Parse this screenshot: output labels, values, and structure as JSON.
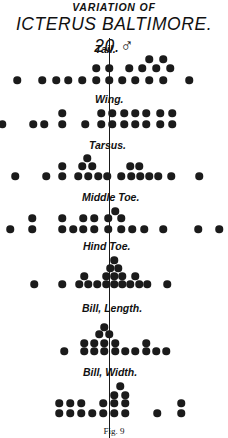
{
  "title": {
    "line1": "VARIATION OF",
    "line2": "ICTERUS BALTIMORE. 20.♂"
  },
  "caption": "Fig. 9",
  "chart_data": {
    "type": "scatter",
    "axis_line_x": 109,
    "series": [
      {
        "name": "Tail.",
        "label_x": 95,
        "label_y": 43,
        "points": [
          [
            17,
            80
          ],
          [
            42,
            80
          ],
          [
            56,
            80
          ],
          [
            68,
            80
          ],
          [
            82,
            80
          ],
          [
            96,
            80
          ],
          [
            109,
            80
          ],
          [
            122,
            80
          ],
          [
            135,
            80
          ],
          [
            149,
            80
          ],
          [
            163,
            80
          ],
          [
            189,
            80
          ],
          [
            96,
            68
          ],
          [
            109,
            68
          ],
          [
            129,
            68
          ],
          [
            142,
            68
          ],
          [
            156,
            68
          ],
          [
            170,
            68
          ],
          [
            149,
            59
          ],
          [
            163,
            59
          ]
        ]
      },
      {
        "name": "Wing.",
        "label_x": 95,
        "label_y": 93,
        "points": [
          [
            2,
            124
          ],
          [
            33,
            124
          ],
          [
            44,
            124
          ],
          [
            62,
            124
          ],
          [
            85,
            124
          ],
          [
            101,
            124
          ],
          [
            112,
            124
          ],
          [
            124,
            124
          ],
          [
            135,
            124
          ],
          [
            146,
            124
          ],
          [
            160,
            124
          ],
          [
            172,
            124
          ],
          [
            62,
            113
          ],
          [
            101,
            113
          ],
          [
            112,
            113
          ],
          [
            124,
            113
          ],
          [
            135,
            113
          ],
          [
            146,
            113
          ],
          [
            160,
            113
          ],
          [
            172,
            113
          ]
        ]
      },
      {
        "name": "Tarsus.",
        "label_x": 89,
        "label_y": 139,
        "points": [
          [
            15,
            176
          ],
          [
            46,
            176
          ],
          [
            62,
            176
          ],
          [
            78,
            176
          ],
          [
            88,
            176
          ],
          [
            98,
            176
          ],
          [
            107,
            176
          ],
          [
            121,
            176
          ],
          [
            131,
            176
          ],
          [
            140,
            176
          ],
          [
            149,
            176
          ],
          [
            158,
            176
          ],
          [
            171,
            176
          ],
          [
            199,
            176
          ],
          [
            62,
            166
          ],
          [
            82,
            166
          ],
          [
            92,
            166
          ],
          [
            130,
            166
          ],
          [
            139,
            166
          ],
          [
            87,
            158
          ]
        ]
      },
      {
        "name": "Middle Toe.",
        "label_x": 82,
        "label_y": 191,
        "points": [
          [
            10,
            229
          ],
          [
            32,
            229
          ],
          [
            62,
            229
          ],
          [
            73,
            229
          ],
          [
            83,
            229
          ],
          [
            94,
            229
          ],
          [
            108,
            229
          ],
          [
            121,
            229
          ],
          [
            132,
            229
          ],
          [
            144,
            229
          ],
          [
            163,
            229
          ],
          [
            198,
            229
          ],
          [
            219,
            229
          ],
          [
            32,
            218
          ],
          [
            62,
            218
          ],
          [
            83,
            218
          ],
          [
            94,
            218
          ],
          [
            108,
            218
          ],
          [
            121,
            218
          ],
          [
            115,
            211
          ]
        ]
      },
      {
        "name": "Hind Toe.",
        "label_x": 83,
        "label_y": 240,
        "points": [
          [
            34,
            284
          ],
          [
            62,
            284
          ],
          [
            79,
            284
          ],
          [
            88,
            284
          ],
          [
            97,
            284
          ],
          [
            106,
            284
          ],
          [
            114,
            284
          ],
          [
            122,
            284
          ],
          [
            130,
            284
          ],
          [
            139,
            284
          ],
          [
            147,
            284
          ],
          [
            167,
            284
          ],
          [
            84,
            276
          ],
          [
            106,
            276
          ],
          [
            114,
            276
          ],
          [
            122,
            276
          ],
          [
            135,
            276
          ],
          [
            110,
            268
          ],
          [
            118,
            268
          ],
          [
            114,
            260
          ]
        ]
      },
      {
        "name": "Bill, Length.",
        "label_x": 82,
        "label_y": 302,
        "points": [
          [
            64,
            351
          ],
          [
            84,
            351
          ],
          [
            94,
            351
          ],
          [
            104,
            351
          ],
          [
            115,
            351
          ],
          [
            125,
            351
          ],
          [
            135,
            351
          ],
          [
            146,
            351
          ],
          [
            156,
            351
          ],
          [
            166,
            351
          ],
          [
            84,
            343
          ],
          [
            94,
            343
          ],
          [
            104,
            343
          ],
          [
            115,
            343
          ],
          [
            146,
            343
          ],
          [
            99,
            334
          ],
          [
            109,
            334
          ],
          [
            104,
            327
          ]
        ]
      },
      {
        "name": "Bill, Width.",
        "label_x": 83,
        "label_y": 366,
        "points": [
          [
            59,
            413
          ],
          [
            70,
            413
          ],
          [
            81,
            413
          ],
          [
            92,
            413
          ],
          [
            103,
            413
          ],
          [
            114,
            413
          ],
          [
            125,
            413
          ],
          [
            157,
            413
          ],
          [
            181,
            413
          ],
          [
            59,
            403
          ],
          [
            70,
            403
          ],
          [
            81,
            403
          ],
          [
            103,
            403
          ],
          [
            114,
            403
          ],
          [
            125,
            403
          ],
          [
            181,
            403
          ],
          [
            114,
            395
          ],
          [
            125,
            395
          ],
          [
            120,
            386
          ]
        ]
      }
    ]
  }
}
